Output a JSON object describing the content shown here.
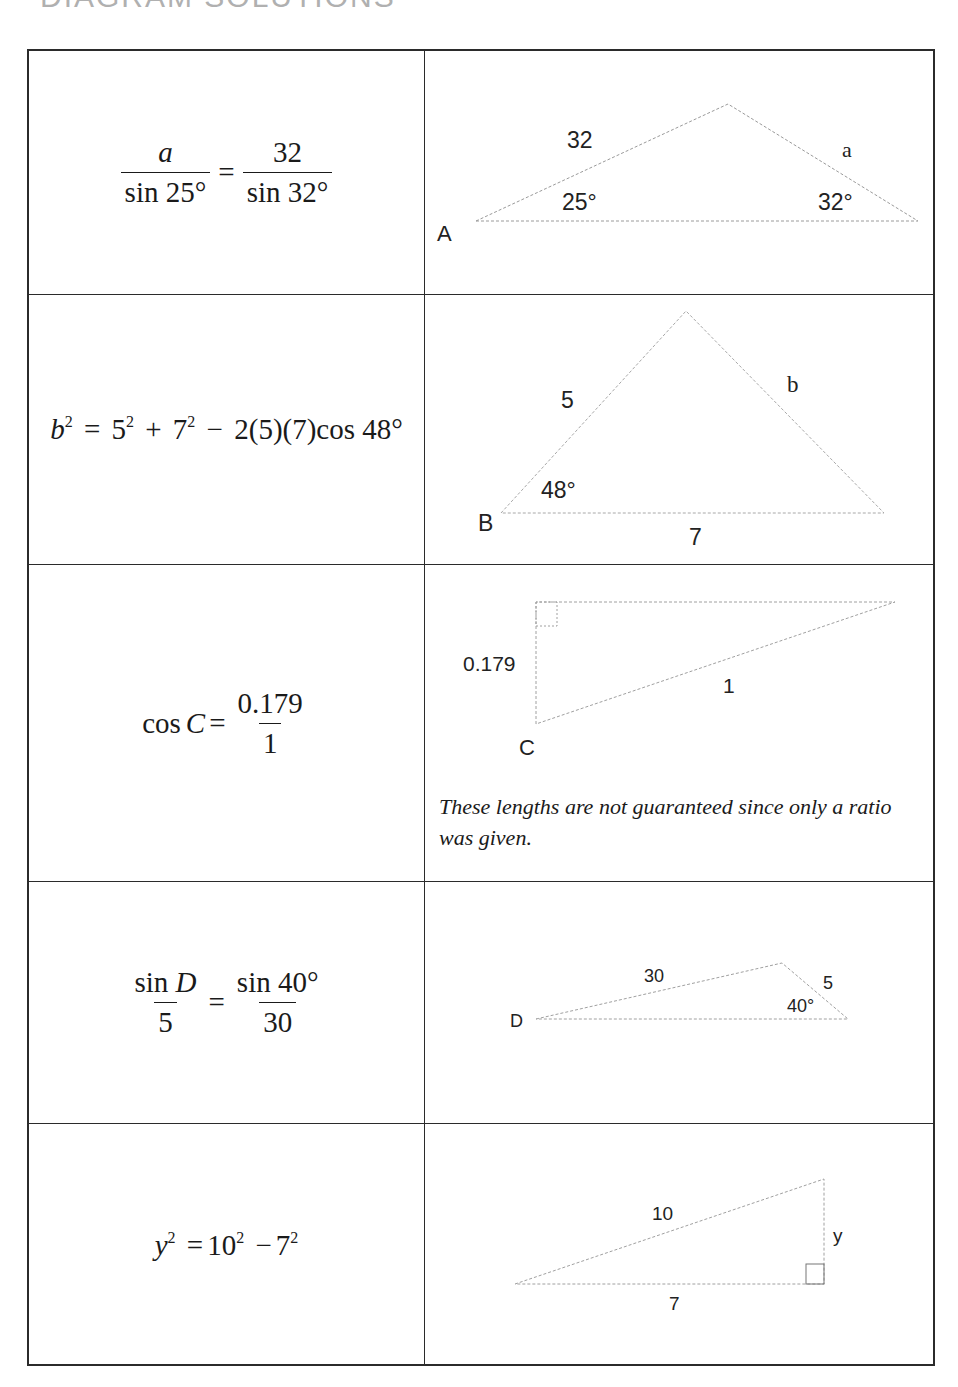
{
  "page": {
    "title": "DIAGRAM SOLUTIONS"
  },
  "rows": [
    {
      "equation": {
        "lhs_num": "a",
        "lhs_den": "sin 25°",
        "rhs_num": "32",
        "rhs_den": "sin 32°",
        "eq": "="
      },
      "diagram": {
        "vertex_label": "A",
        "side_left": "32",
        "side_right": "a",
        "angle_left": "25°",
        "angle_right": "32°"
      }
    },
    {
      "equation": {
        "b": "b",
        "b_exp": "2",
        "eq": "=",
        "t1": "5",
        "t1_exp": "2",
        "plus": "+",
        "t2": "7",
        "t2_exp": "2",
        "minus": "−",
        "tail": "2(5)(7)cos 48°"
      },
      "diagram": {
        "vertex_label": "B",
        "side_left": "5",
        "side_right": "b",
        "side_base": "7",
        "angle": "48°"
      }
    },
    {
      "equation": {
        "lhs": "cos",
        "var": "C",
        "eq": "=",
        "num": "0.179",
        "den": "1"
      },
      "diagram": {
        "vertex_label": "C",
        "side_vertical": "0.179",
        "side_hyp": "1"
      },
      "note": "These lengths are not guaranteed since only a ratio was given."
    },
    {
      "equation": {
        "lhs_num_fn": "sin",
        "lhs_num_var": "D",
        "lhs_den": "5",
        "eq": "=",
        "rhs_num": "sin 40°",
        "rhs_den": "30"
      },
      "diagram": {
        "vertex_label": "D",
        "side_top": "30",
        "side_right": "5",
        "angle": "40°"
      }
    },
    {
      "equation": {
        "y": "y",
        "y_exp": "2",
        "eq": "=",
        "t1": "10",
        "t1_exp": "2",
        "minus": "−",
        "t2": "7",
        "t2_exp": "2"
      },
      "diagram": {
        "side_hyp": "10",
        "side_vertical": "y",
        "side_base": "7"
      }
    }
  ]
}
